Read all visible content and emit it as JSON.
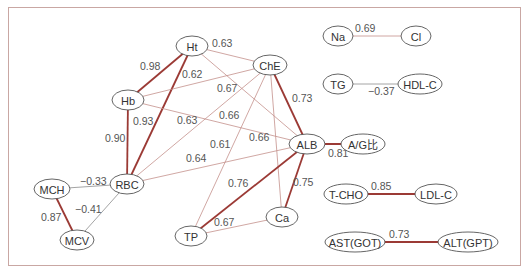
{
  "diagram": {
    "type": "correlation-network",
    "colors": {
      "strong": "#9b3a35",
      "medium": "#c4918b",
      "negative": "#8d8d8d",
      "frame": "#c9a7a3"
    },
    "nodes": [
      {
        "id": "Ht",
        "label": "Ht",
        "x": 192,
        "y": 46,
        "rx": 16,
        "ry": 10
      },
      {
        "id": "Hb",
        "label": "Hb",
        "x": 128,
        "y": 100,
        "rx": 16,
        "ry": 10
      },
      {
        "id": "ChE",
        "label": "ChE",
        "x": 270,
        "y": 65,
        "rx": 17,
        "ry": 10
      },
      {
        "id": "ALB",
        "label": "ALB",
        "x": 307,
        "y": 144,
        "rx": 18,
        "ry": 10
      },
      {
        "id": "AG",
        "label": "A/G比",
        "x": 363,
        "y": 144,
        "rx": 22,
        "ry": 10
      },
      {
        "id": "RBC",
        "label": "RBC",
        "x": 127,
        "y": 184,
        "rx": 17,
        "ry": 10
      },
      {
        "id": "MCH",
        "label": "MCH",
        "x": 52,
        "y": 189,
        "rx": 18,
        "ry": 10
      },
      {
        "id": "MCV",
        "label": "MCV",
        "x": 77,
        "y": 240,
        "rx": 17,
        "ry": 10
      },
      {
        "id": "TP",
        "label": "TP",
        "x": 191,
        "y": 236,
        "rx": 16,
        "ry": 10
      },
      {
        "id": "Ca",
        "label": "Ca",
        "x": 282,
        "y": 217,
        "rx": 16,
        "ry": 10
      },
      {
        "id": "Na",
        "label": "Na",
        "x": 338,
        "y": 36,
        "rx": 15,
        "ry": 10
      },
      {
        "id": "Cl",
        "label": "Cl",
        "x": 416,
        "y": 36,
        "rx": 15,
        "ry": 10
      },
      {
        "id": "TG",
        "label": "TG",
        "x": 338,
        "y": 84,
        "rx": 15,
        "ry": 10
      },
      {
        "id": "HDL",
        "label": "HDL-C",
        "x": 420,
        "y": 84,
        "rx": 22,
        "ry": 10
      },
      {
        "id": "TCHO",
        "label": "T-CHO",
        "x": 346,
        "y": 194,
        "rx": 22,
        "ry": 10
      },
      {
        "id": "LDL",
        "label": "LDL-C",
        "x": 436,
        "y": 194,
        "rx": 21,
        "ry": 10
      },
      {
        "id": "AST",
        "label": "AST(GOT)",
        "x": 355,
        "y": 242,
        "rx": 30,
        "ry": 10
      },
      {
        "id": "ALT",
        "label": "ALT(GPT)",
        "x": 468,
        "y": 242,
        "rx": 30,
        "ry": 10
      }
    ],
    "edges": [
      {
        "from": "Ht",
        "to": "Hb",
        "value": "0.98",
        "strength": "strong",
        "lx": 140,
        "ly": 70
      },
      {
        "from": "Ht",
        "to": "RBC",
        "value": "0.93",
        "strength": "strong",
        "lx": 133,
        "ly": 125
      },
      {
        "from": "Hb",
        "to": "RBC",
        "value": "0.90",
        "strength": "strong",
        "lx": 105,
        "ly": 142
      },
      {
        "from": "Ht",
        "to": "ChE",
        "value": "0.63",
        "strength": "medium",
        "lx": 212,
        "ly": 47
      },
      {
        "from": "Hb",
        "to": "ChE",
        "value": "0.62",
        "strength": "medium",
        "lx": 182,
        "ly": 78
      },
      {
        "from": "Ht",
        "to": "ALB",
        "value": "0.67",
        "strength": "medium",
        "lx": 217,
        "ly": 92
      },
      {
        "from": "Hb",
        "to": "ALB",
        "value": "0.66",
        "strength": "medium",
        "lx": 219,
        "ly": 119
      },
      {
        "from": "RBC",
        "to": "ChE",
        "value": "0.63",
        "strength": "medium",
        "lx": 177,
        "ly": 124
      },
      {
        "from": "RBC",
        "to": "ALB",
        "value": "0.64",
        "strength": "medium",
        "lx": 186,
        "ly": 162
      },
      {
        "from": "TP",
        "to": "ChE",
        "value": "0.61",
        "strength": "medium",
        "lx": 210,
        "ly": 148
      },
      {
        "from": "Ca",
        "to": "ChE",
        "value": "0.66",
        "strength": "medium",
        "lx": 249,
        "ly": 141
      },
      {
        "from": "ChE",
        "to": "ALB",
        "value": "0.73",
        "strength": "strong",
        "lx": 292,
        "ly": 102
      },
      {
        "from": "ALB",
        "to": "TP",
        "value": "0.76",
        "strength": "strong",
        "lx": 228,
        "ly": 187
      },
      {
        "from": "ALB",
        "to": "Ca",
        "value": "0.75",
        "strength": "strong",
        "lx": 293,
        "ly": 186
      },
      {
        "from": "ALB",
        "to": "AG",
        "value": "0.81",
        "strength": "strong",
        "lx": 328,
        "ly": 157
      },
      {
        "from": "TP",
        "to": "Ca",
        "value": "0.67",
        "strength": "medium",
        "lx": 214,
        "ly": 226
      },
      {
        "from": "MCH",
        "to": "RBC",
        "value": "−0.33",
        "strength": "negative",
        "lx": 80,
        "ly": 185
      },
      {
        "from": "MCV",
        "to": "RBC",
        "value": "−0.41",
        "strength": "negative",
        "lx": 75,
        "ly": 213
      },
      {
        "from": "MCH",
        "to": "MCV",
        "value": "0.87",
        "strength": "strong",
        "lx": 41,
        "ly": 221
      },
      {
        "from": "Na",
        "to": "Cl",
        "value": "0.69",
        "strength": "medium",
        "lx": 355,
        "ly": 32
      },
      {
        "from": "TG",
        "to": "HDL",
        "value": "−0.37",
        "strength": "negative",
        "lx": 368,
        "ly": 95
      },
      {
        "from": "TCHO",
        "to": "LDL",
        "value": "0.85",
        "strength": "strong",
        "lx": 371,
        "ly": 190
      },
      {
        "from": "AST",
        "to": "ALT",
        "value": "0.73",
        "strength": "strong",
        "lx": 389,
        "ly": 238
      }
    ]
  }
}
